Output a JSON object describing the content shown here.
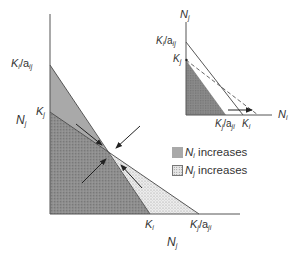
{
  "main_plot": {
    "y_axis_label": {
      "base": "N",
      "sub": "j"
    },
    "x_axis_label": {
      "base": "N",
      "sub": "j"
    },
    "y_ticks": [
      {
        "base": "K",
        "sub": "i",
        "suffix": "/a",
        "suffix_sub": "ij"
      },
      {
        "base": "K",
        "sub": "j",
        "suffix": "",
        "suffix_sub": ""
      }
    ],
    "x_ticks": [
      {
        "base": "K",
        "sub": "i",
        "suffix": "",
        "suffix_sub": ""
      },
      {
        "base": "K",
        "sub": "j",
        "suffix": "/a",
        "suffix_sub": "ji"
      }
    ],
    "arrows_count": 4,
    "equilibrium": "stable intersection"
  },
  "inset_plot": {
    "y_axis_label": {
      "base": "N",
      "sub": "j"
    },
    "x_axis_label": {
      "base": "N",
      "sub": "i"
    },
    "y_ticks": [
      {
        "base": "K",
        "sub": "i",
        "suffix": "/a",
        "suffix_sub": "ij"
      },
      {
        "base": "K",
        "sub": "j",
        "suffix": "",
        "suffix_sub": ""
      }
    ],
    "x_ticks": [
      {
        "base": "K",
        "sub": "j",
        "suffix": "/a",
        "suffix_sub": "ji"
      },
      {
        "base": "K",
        "sub": "i",
        "suffix": "",
        "suffix_sub": ""
      }
    ]
  },
  "legend": [
    {
      "base": "N",
      "sub": "i",
      "text": " increases",
      "style": "gray"
    },
    {
      "base": "N",
      "sub": "j",
      "text": " increases",
      "style": "stipple"
    }
  ],
  "colors": {
    "axis": "#555555",
    "gray_region": "#a9a9a9",
    "dark_stipple": "#8c8c8c",
    "light_stipple": "#e4e4e4",
    "line": "#444444",
    "arrow": "#222222"
  }
}
